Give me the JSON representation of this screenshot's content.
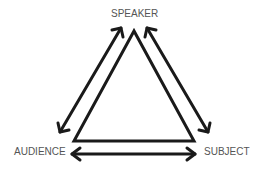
{
  "diagram": {
    "type": "rhetorical-triangle",
    "nodes": [
      {
        "id": "speaker",
        "label": "SPEAKER",
        "position": "top"
      },
      {
        "id": "audience",
        "label": "AUDIENCE",
        "position": "bottom-left"
      },
      {
        "id": "subject",
        "label": "SUBJECT",
        "position": "bottom-right"
      }
    ],
    "edges": [
      {
        "from": "speaker",
        "to": "audience",
        "style": "double-arrow"
      },
      {
        "from": "speaker",
        "to": "subject",
        "style": "double-arrow"
      },
      {
        "from": "audience",
        "to": "subject",
        "style": "double-arrow"
      }
    ],
    "colors": {
      "stroke": "#1a1a1a",
      "label": "#555555",
      "background": "#ffffff"
    }
  }
}
